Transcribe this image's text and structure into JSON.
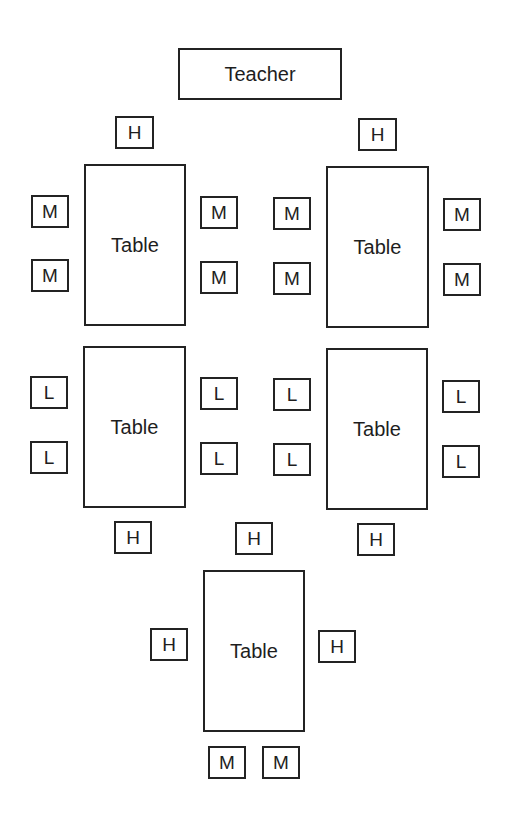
{
  "diagram": {
    "type": "classroom seating arrangement",
    "teacher": {
      "label": "Teacher"
    },
    "tables": [
      {
        "label": "Table",
        "position": "top-left",
        "seats": {
          "top": [
            "H"
          ],
          "left": [
            "M",
            "M"
          ],
          "right": [
            "M",
            "M"
          ],
          "bottom": []
        }
      },
      {
        "label": "Table",
        "position": "top-right",
        "seats": {
          "top": [
            "H"
          ],
          "left": [
            "M",
            "M"
          ],
          "right": [
            "M",
            "M"
          ],
          "bottom": []
        }
      },
      {
        "label": "Table",
        "position": "middle-left",
        "seats": {
          "top": [],
          "left": [
            "L",
            "L"
          ],
          "right": [
            "L",
            "L"
          ],
          "bottom": [
            "H"
          ]
        }
      },
      {
        "label": "Table",
        "position": "middle-right",
        "seats": {
          "top": [],
          "left": [
            "L",
            "L"
          ],
          "right": [
            "L",
            "L"
          ],
          "bottom": [
            "H"
          ]
        }
      },
      {
        "label": "Table",
        "position": "bottom-center",
        "seats": {
          "top": [
            "H"
          ],
          "left": [
            "H"
          ],
          "right": [
            "H"
          ],
          "bottom": [
            "M",
            "M"
          ]
        }
      }
    ],
    "legend_codes": [
      "H",
      "M",
      "L"
    ]
  }
}
